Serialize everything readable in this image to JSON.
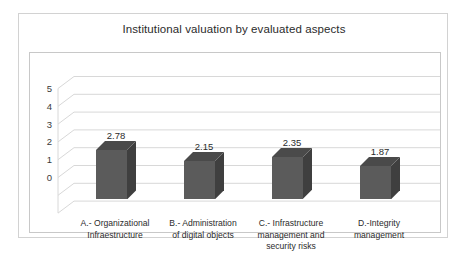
{
  "chart_data": {
    "type": "bar",
    "title": "Institutional valuation by evaluated aspects",
    "xlabel": "",
    "ylabel": "",
    "ylim": [
      0,
      5
    ],
    "yticks": [
      "5",
      "4",
      "3",
      "2",
      "1",
      "0"
    ],
    "grid": true,
    "legend": "none",
    "style": "3d-column",
    "categories": [
      "A.- Organizational Infraestructure",
      "B.- Administration of digital objects",
      "C.- Infrastructure management and security risks",
      "D.-Integrity management"
    ],
    "category_lines": [
      [
        "A.- Organizational",
        "Infraestructure"
      ],
      [
        "B.- Administration",
        "of digital objects"
      ],
      [
        "C.- Infrastructure",
        "management and",
        "security risks"
      ],
      [
        "D.-Integrity",
        "management"
      ]
    ],
    "values": [
      2.78,
      2.15,
      2.35,
      1.87
    ],
    "value_labels": [
      "2.78",
      "2.15",
      "2.35",
      "1.87"
    ],
    "series": [
      {
        "name": "Institutional valuation",
        "values": [
          2.78,
          2.15,
          2.35,
          1.87
        ]
      }
    ],
    "colors": {
      "bar_front": "#5b5b5b",
      "bar_side": "#3f3f3f",
      "bar_top": "#4a4a4a",
      "gridline": "#d8d8d8",
      "plot_border": "#c8c8c8",
      "frame_border": "#d2d2d2",
      "text": "#2b2b2b",
      "background": "#ffffff"
    }
  }
}
